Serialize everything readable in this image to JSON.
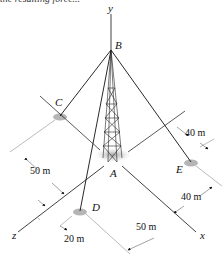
{
  "caption_fragment": "the resulting force...",
  "axes": {
    "x": "x",
    "y": "y",
    "z": "z"
  },
  "points": {
    "A": "A",
    "B": "B",
    "C": "C",
    "D": "D",
    "E": "E"
  },
  "dimensions": {
    "c_offset": "50 m",
    "e_offset_upper": "40 m",
    "e_offset_lower": "40 m",
    "d_offset_x": "50 m",
    "d_offset_z": "20 m"
  },
  "colors": {
    "line": "#111111",
    "dim_line": "#555555",
    "ground_shadow": "#b0b0b0"
  }
}
